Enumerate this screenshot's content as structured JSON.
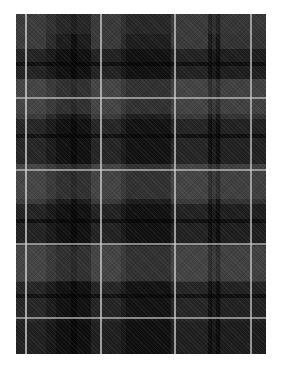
{
  "image": {
    "subject": "tartan plaid fabric swatch",
    "description": "Dark grey/black tartan pattern with thin light-grey over-check lines",
    "colors": {
      "base": "#2a2a2a",
      "dark_band": "#151515",
      "mid_band": "#3c3c3c",
      "light_band": "#4a4a4a",
      "pinstripe": "#c8c8c8",
      "background": "#ffffff"
    }
  }
}
